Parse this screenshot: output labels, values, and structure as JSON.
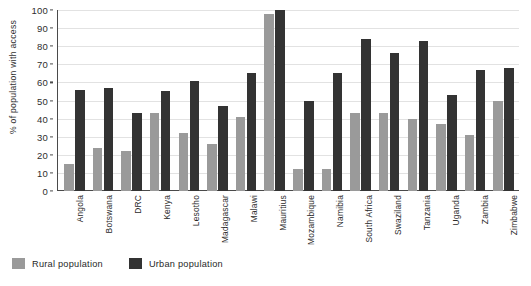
{
  "chart_data": {
    "type": "bar",
    "title": "",
    "xlabel": "",
    "ylabel": "% of population with access",
    "ylim": [
      0,
      100
    ],
    "yticks": [
      0,
      10,
      20,
      30,
      40,
      50,
      60,
      70,
      80,
      90,
      100
    ],
    "grid": true,
    "legend_position": "bottom-left",
    "categories": [
      "Angola",
      "Botswana",
      "DRC",
      "Kenya",
      "Lesotho",
      "Madagascar",
      "Malawi",
      "Mauritius",
      "Mozambique",
      "Namibia",
      "South Africa",
      "Swaziland",
      "Tanzania",
      "Uganda",
      "Zambia",
      "Zimbabwe"
    ],
    "series": [
      {
        "name": "Rural population",
        "color": "#9a9a9a",
        "values": [
          15,
          24,
          22,
          43,
          32,
          26,
          41,
          98,
          12,
          12,
          43,
          43,
          40,
          37,
          31,
          50
        ]
      },
      {
        "name": "Urban population",
        "color": "#333333",
        "values": [
          56,
          57,
          43,
          55,
          61,
          47,
          65,
          100,
          50,
          65,
          84,
          76,
          83,
          53,
          67,
          68
        ]
      }
    ]
  },
  "legend": {
    "items": [
      {
        "label": "Rural population",
        "color": "#9a9a9a"
      },
      {
        "label": "Urban population",
        "color": "#333333"
      }
    ]
  }
}
